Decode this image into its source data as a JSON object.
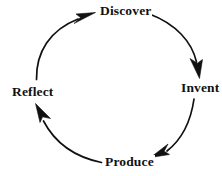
{
  "diagram": {
    "type": "cycle",
    "direction": "clockwise",
    "stroke_color": "#111111",
    "background_color": "#ffffff",
    "nodes": [
      {
        "id": "discover",
        "label": "Discover",
        "position": "top"
      },
      {
        "id": "invent",
        "label": "Invent",
        "position": "right"
      },
      {
        "id": "produce",
        "label": "Produce",
        "position": "bottom"
      },
      {
        "id": "reflect",
        "label": "Reflect",
        "position": "left"
      }
    ],
    "arrows": [
      {
        "id": "reflect-to-discover",
        "from": "Reflect",
        "to": "Discover",
        "icon": "curved-arrow-icon"
      },
      {
        "id": "discover-to-invent",
        "from": "Discover",
        "to": "Invent",
        "icon": "curved-arrow-icon"
      },
      {
        "id": "invent-to-produce",
        "from": "Invent",
        "to": "Produce",
        "icon": "curved-arrow-icon"
      },
      {
        "id": "produce-to-reflect",
        "from": "Produce",
        "to": "Reflect",
        "icon": "curved-arrow-icon"
      }
    ]
  }
}
